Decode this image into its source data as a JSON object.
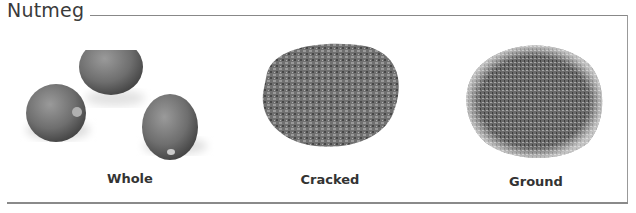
{
  "header": {
    "title": "Nutmeg"
  },
  "items": [
    {
      "label": "Whole",
      "image": "whole-nutmeg-seeds"
    },
    {
      "label": "Cracked",
      "image": "cracked-nutmeg-pile"
    },
    {
      "label": "Ground",
      "image": "ground-nutmeg-pile"
    }
  ]
}
